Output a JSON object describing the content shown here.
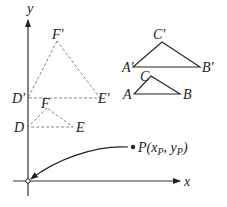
{
  "diagram": {
    "axes": {
      "x_label": "x",
      "y_label": "y"
    },
    "triangle_DEF": {
      "labels": {
        "D": "D",
        "E": "E",
        "F": "F"
      },
      "style": "dashed"
    },
    "triangle_DEF_prime": {
      "labels": {
        "D": "D'",
        "E": "E'",
        "F": "F'"
      },
      "style": "dashed"
    },
    "triangle_ABC": {
      "labels": {
        "A": "A",
        "B": "B",
        "C": "C"
      },
      "style": "solid"
    },
    "triangle_ABC_prime": {
      "labels": {
        "A": "A'",
        "B": "B'",
        "C": "C'"
      },
      "style": "solid"
    },
    "point_P": {
      "label_main": "P(x",
      "sub_x": "P",
      "label_mid": ", y",
      "sub_y": "P",
      "label_end": ")"
    },
    "colors": {
      "line": "#333333",
      "dashed": "#777777",
      "text": "#222222"
    }
  }
}
